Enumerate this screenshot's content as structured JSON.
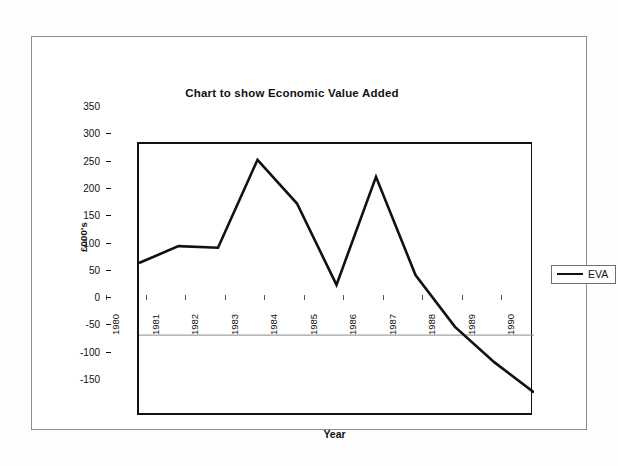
{
  "chart_data": {
    "type": "line",
    "title": "Chart to show Economic Value Added",
    "xlabel": "Year",
    "ylabel": "£000's",
    "categories": [
      "1980",
      "1981",
      "1982",
      "1983",
      "1984",
      "1985",
      "1986",
      "1987",
      "1988",
      "1989",
      "1990"
    ],
    "series": [
      {
        "name": "EVA",
        "values": [
          132,
          163,
          160,
          321,
          241,
          92,
          290,
          110,
          15,
          -50,
          -105
        ],
        "color": "#111111"
      }
    ],
    "ylim": [
      -150,
      350
    ],
    "ytick_labels": [
      "350",
      "300",
      "250",
      "200",
      "150",
      "100",
      "50",
      "0",
      "-50",
      "-100",
      "-150"
    ],
    "ytick_values": [
      350,
      300,
      250,
      200,
      150,
      100,
      50,
      0,
      -50,
      -100,
      -150
    ],
    "ystep": 50,
    "grid": false,
    "zero_line": true,
    "legend_position": "right",
    "legend_entries": [
      "EVA"
    ]
  },
  "legend": {
    "label": "EVA",
    "swatch_name": "line-swatch"
  },
  "colors": {
    "line": "#111111",
    "axis": "#111111",
    "zero_line": "#8a8a8a",
    "frame": "#8d8d8d",
    "background": "#ffffff"
  }
}
